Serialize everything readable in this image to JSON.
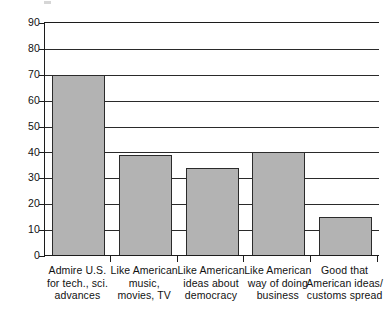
{
  "chart_data": {
    "type": "bar",
    "title": "",
    "subtitle": "",
    "xlabel": "",
    "ylabel": "",
    "ylim": [
      0,
      90
    ],
    "ytick_step": 10,
    "grid": true,
    "legend": "none",
    "orientation": "vertical",
    "bar_color": "#b3b3b3",
    "bar_edge_color": "#2b2b2b",
    "axis_color": "#1c1c1c",
    "categories": [
      "Admire U.S.\nfor tech., sci.\nadvances",
      "Like American\nmusic,\nmovies, TV",
      "Like American\nideas about\ndemocracy",
      "Like American\nway of doing\nbusiness",
      "Good that\nAmerican ideas/\ncustoms spread"
    ],
    "values": [
      70,
      39,
      34,
      40,
      15
    ],
    "yticks": [
      0,
      10,
      20,
      30,
      40,
      50,
      60,
      70,
      80,
      90
    ],
    "ytick_labels": [
      "0",
      "10",
      "20",
      "30",
      "40",
      "50",
      "60",
      "70",
      "80",
      "90"
    ]
  },
  "axis": {
    "y_labels": [
      "90",
      "80",
      "70",
      "60",
      "50",
      "40",
      "30",
      "20",
      "10",
      "0"
    ]
  },
  "categories": [
    {
      "line1": "Admire U.S.",
      "line2": "for tech., sci.",
      "line3": "advances"
    },
    {
      "line1": "Like American",
      "line2": "music,",
      "line3": "movies, TV"
    },
    {
      "line1": "Like American",
      "line2": "ideas about",
      "line3": "democracy"
    },
    {
      "line1": "Like American",
      "line2": "way of doing",
      "line3": "business"
    },
    {
      "line1": "Good that",
      "line2": "American ideas/",
      "line3": "customs spread"
    }
  ]
}
